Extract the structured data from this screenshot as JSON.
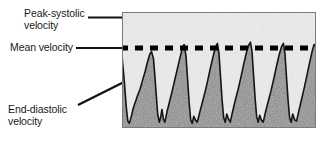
{
  "figure": {
    "type": "doppler-spectral-waveform-annotated-diagram",
    "caption_labels": {
      "peak_systolic": "Peak-systolic\nvelocity",
      "mean": "Mean velocity",
      "end_diastolic": "End-diastolic\nvelocity"
    }
  },
  "annotations": [
    {
      "id": "peak-systolic",
      "label": "Peak-systolic\nvelocity",
      "arrow": "horizontal-right",
      "points_to": "waveform-peak"
    },
    {
      "id": "mean-velocity",
      "label": "Mean velocity",
      "arrow": "horizontal-right",
      "points_to": "dashed-mean-line"
    },
    {
      "id": "end-diastolic",
      "label": "End-diastolic\nvelocity",
      "arrow": "diagonal-up-right",
      "points_to": "waveform-trough"
    }
  ],
  "chart_data": {
    "type": "line",
    "title": "",
    "xlabel": "",
    "ylabel": "",
    "grid": false,
    "legend": null,
    "axis_note": "Velocity increases upward; time advances left to right. No numeric tick labels are printed on the image.",
    "mean_line": {
      "style": "dashed",
      "color": "#000000",
      "thickness_px": 5,
      "y_fraction_of_panel": 0.31,
      "dash_px": 8,
      "gap_px": 7
    },
    "series": [
      {
        "name": "velocity-waveform",
        "color": "#1a1a1a",
        "cycles": 6,
        "points_fraction": [
          [
            0.0,
            0.62
          ],
          [
            0.012,
            0.4
          ],
          [
            0.022,
            0.18
          ],
          [
            0.03,
            0.06
          ],
          [
            0.038,
            0.04
          ],
          [
            0.048,
            0.1
          ],
          [
            0.058,
            0.17
          ],
          [
            0.068,
            0.22
          ],
          [
            0.08,
            0.28
          ],
          [
            0.092,
            0.33
          ],
          [
            0.104,
            0.4
          ],
          [
            0.118,
            0.48
          ],
          [
            0.13,
            0.56
          ],
          [
            0.142,
            0.63
          ],
          [
            0.152,
            0.66
          ],
          [
            0.162,
            0.6
          ],
          [
            0.168,
            0.48
          ],
          [
            0.176,
            0.3
          ],
          [
            0.184,
            0.12
          ],
          [
            0.192,
            0.05
          ],
          [
            0.199,
            0.09
          ],
          [
            0.206,
            0.16
          ],
          [
            0.213,
            0.08
          ],
          [
            0.221,
            0.05
          ],
          [
            0.232,
            0.14
          ],
          [
            0.244,
            0.22
          ],
          [
            0.256,
            0.3
          ],
          [
            0.27,
            0.4
          ],
          [
            0.284,
            0.5
          ],
          [
            0.298,
            0.6
          ],
          [
            0.31,
            0.68
          ],
          [
            0.32,
            0.72
          ],
          [
            0.33,
            0.62
          ],
          [
            0.338,
            0.42
          ],
          [
            0.346,
            0.22
          ],
          [
            0.354,
            0.07
          ],
          [
            0.362,
            0.04
          ],
          [
            0.37,
            0.1
          ],
          [
            0.378,
            0.07
          ],
          [
            0.388,
            0.05
          ],
          [
            0.4,
            0.13
          ],
          [
            0.414,
            0.22
          ],
          [
            0.428,
            0.31
          ],
          [
            0.442,
            0.41
          ],
          [
            0.456,
            0.52
          ],
          [
            0.47,
            0.62
          ],
          [
            0.482,
            0.7
          ],
          [
            0.492,
            0.73
          ],
          [
            0.5,
            0.64
          ],
          [
            0.508,
            0.44
          ],
          [
            0.516,
            0.24
          ],
          [
            0.524,
            0.09
          ],
          [
            0.532,
            0.05
          ],
          [
            0.54,
            0.12
          ],
          [
            0.548,
            0.08
          ],
          [
            0.558,
            0.05
          ],
          [
            0.57,
            0.14
          ],
          [
            0.584,
            0.24
          ],
          [
            0.598,
            0.33
          ],
          [
            0.612,
            0.43
          ],
          [
            0.626,
            0.54
          ],
          [
            0.64,
            0.64
          ],
          [
            0.652,
            0.71
          ],
          [
            0.662,
            0.74
          ],
          [
            0.67,
            0.66
          ],
          [
            0.678,
            0.46
          ],
          [
            0.686,
            0.26
          ],
          [
            0.694,
            0.1
          ],
          [
            0.702,
            0.05
          ],
          [
            0.71,
            0.11
          ],
          [
            0.718,
            0.07
          ],
          [
            0.728,
            0.05
          ],
          [
            0.74,
            0.14
          ],
          [
            0.754,
            0.23
          ],
          [
            0.768,
            0.32
          ],
          [
            0.782,
            0.42
          ],
          [
            0.796,
            0.53
          ],
          [
            0.81,
            0.63
          ],
          [
            0.822,
            0.7
          ],
          [
            0.832,
            0.73
          ],
          [
            0.84,
            0.64
          ],
          [
            0.848,
            0.44
          ],
          [
            0.856,
            0.24
          ],
          [
            0.864,
            0.09
          ],
          [
            0.872,
            0.05
          ],
          [
            0.88,
            0.12
          ],
          [
            0.89,
            0.07
          ],
          [
            0.9,
            0.06
          ],
          [
            0.912,
            0.15
          ],
          [
            0.926,
            0.25
          ],
          [
            0.94,
            0.35
          ],
          [
            0.954,
            0.46
          ],
          [
            0.968,
            0.57
          ],
          [
            0.98,
            0.66
          ],
          [
            0.99,
            0.72
          ],
          [
            1.0,
            0.7
          ]
        ]
      }
    ]
  }
}
